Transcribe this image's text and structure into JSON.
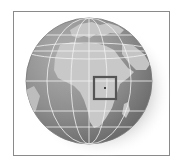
{
  "map": {
    "title": "",
    "projection": "orthographic",
    "region_visible": [
      "Africa",
      "Europe",
      "Middle East",
      "Arabian Peninsula",
      "Atlantic Ocean",
      "Indian Ocean"
    ],
    "highlight": {
      "shape": "square",
      "description": "location marker in East-Central Africa",
      "color": "#5a5a5a"
    },
    "colors": {
      "ocean": "#8c8c8c",
      "land": "#c4c4c4",
      "graticule": "#f0f0f0",
      "frame": "#8a8a8a",
      "shadow": "#d8d8d8"
    }
  }
}
